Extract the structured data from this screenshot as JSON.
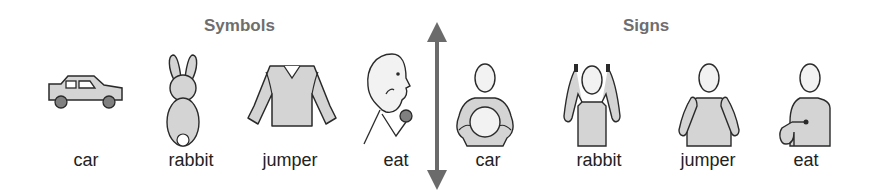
{
  "colors": {
    "heading": "#6e6e6e",
    "label": "#222222",
    "fill_light": "#d4d4d4",
    "fill_face": "#f2f2f2",
    "fill_dark": "#808080",
    "stroke": "#2a2a2a",
    "arrow": "#6b6b6b"
  },
  "symbols": {
    "heading": "Symbols",
    "items": [
      {
        "label": "car",
        "icon": "car-symbol-icon"
      },
      {
        "label": "rabbit",
        "icon": "rabbit-symbol-icon"
      },
      {
        "label": "jumper",
        "icon": "jumper-symbol-icon"
      },
      {
        "label": "eat",
        "icon": "eat-symbol-icon"
      }
    ]
  },
  "divider": {
    "icon": "double-headed-arrow-icon"
  },
  "signs": {
    "heading": "Signs",
    "items": [
      {
        "label": "car",
        "icon": "car-sign-icon"
      },
      {
        "label": "rabbit",
        "icon": "rabbit-sign-icon"
      },
      {
        "label": "jumper",
        "icon": "jumper-sign-icon"
      },
      {
        "label": "eat",
        "icon": "eat-sign-icon"
      }
    ]
  }
}
